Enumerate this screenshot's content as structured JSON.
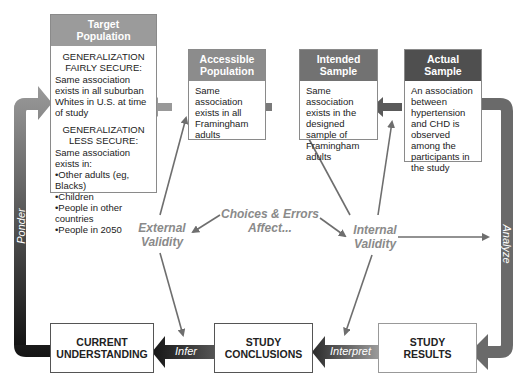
{
  "diagram": {
    "top_boxes": [
      {
        "id": "target",
        "title": "Target Population",
        "title_lines": [
          "Target",
          "Population"
        ],
        "header_color": "#9b9b9b",
        "sections": [
          {
            "heading_lines": [
              "GENERALIZATION",
              "FAIRLY SECURE:"
            ],
            "text": "Same association exists in all suburban Whites in U.S. at time of study"
          },
          {
            "heading_lines": [
              "GENERALIZATION",
              "LESS SECURE:"
            ],
            "text": "Same association exists in:",
            "bullets": [
              "Other adults (eg, Blacks)",
              "Children",
              "People in other countries",
              "People in 2050"
            ]
          }
        ]
      },
      {
        "id": "accessible",
        "title_lines": [
          "Accessible",
          "Population"
        ],
        "header_color": "#8c8c8c",
        "text": "Same association exists in all Framingham adults"
      },
      {
        "id": "intended",
        "title_lines": [
          "Intended",
          "Sample"
        ],
        "header_color": "#727272",
        "text": "Same association exists in the designed sample of Framingham adults"
      },
      {
        "id": "actual",
        "title_lines": [
          "Actual",
          "Sample"
        ],
        "header_color": "#4f4f4f",
        "text": "An association between hypertension and CHD is observed among the participants in the study"
      }
    ],
    "bottom_boxes": [
      {
        "id": "current",
        "lines": [
          "CURRENT",
          "UNDERSTANDING"
        ]
      },
      {
        "id": "conclusions",
        "lines": [
          "STUDY",
          "CONCLUSIONS"
        ]
      },
      {
        "id": "results",
        "lines": [
          "STUDY",
          "RESULTS"
        ]
      }
    ],
    "center_labels": {
      "external_validity": [
        "External",
        "Validity"
      ],
      "choices_errors": [
        "Choices & Errors",
        "Affect..."
      ],
      "internal_validity": [
        "Internal",
        "Validity"
      ]
    },
    "flow_labels": {
      "ponder": "Ponder",
      "analyze": "Analyze",
      "infer": "Infer",
      "interpret": "Interpret"
    },
    "colors": {
      "dark_arrow": "#1e1e1e",
      "mid_arrow": "#6a6a6a",
      "light_arrow": "#8c8c8c",
      "validity_text": "#8a8a8a"
    }
  }
}
